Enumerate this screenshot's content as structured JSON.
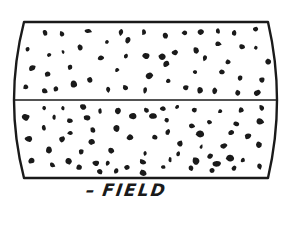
{
  "figure": {
    "type": "magnetic-particle field diagram",
    "caption_prefix": "–",
    "caption": "FIELD",
    "colors": {
      "ink": "#1a1a1a",
      "background": "#ffffff"
    },
    "frame": {
      "top_y": 22,
      "bottom_y": 178,
      "left_x_top": 24,
      "right_x_top": 268,
      "left_bulge_x": 12,
      "right_bulge_x": 278,
      "divider_y": 100
    },
    "particles": [
      [
        45,
        33
      ],
      [
        62,
        34
      ],
      [
        88,
        31
      ],
      [
        121,
        32
      ],
      [
        144,
        32
      ],
      [
        165,
        36
      ],
      [
        185,
        33
      ],
      [
        201,
        32
      ],
      [
        218,
        31
      ],
      [
        234,
        33
      ],
      [
        256,
        29
      ],
      [
        28,
        49
      ],
      [
        49,
        55
      ],
      [
        63,
        52
      ],
      [
        80,
        48
      ],
      [
        107,
        42
      ],
      [
        128,
        40
      ],
      [
        146,
        56
      ],
      [
        162,
        57
      ],
      [
        196,
        50
      ],
      [
        218,
        44
      ],
      [
        242,
        47
      ],
      [
        256,
        48
      ],
      [
        101,
        58
      ],
      [
        126,
        56
      ],
      [
        175,
        53
      ],
      [
        205,
        58
      ],
      [
        228,
        62
      ],
      [
        268,
        62
      ],
      [
        32,
        68
      ],
      [
        48,
        74
      ],
      [
        70,
        67
      ],
      [
        117,
        70
      ],
      [
        150,
        76
      ],
      [
        166,
        64
      ],
      [
        195,
        72
      ],
      [
        222,
        72
      ],
      [
        240,
        78
      ],
      [
        262,
        80
      ],
      [
        26,
        87
      ],
      [
        45,
        91
      ],
      [
        56,
        89
      ],
      [
        74,
        84
      ],
      [
        90,
        80
      ],
      [
        108,
        89
      ],
      [
        126,
        88
      ],
      [
        145,
        90
      ],
      [
        168,
        81
      ],
      [
        186,
        88
      ],
      [
        200,
        90
      ],
      [
        215,
        91
      ],
      [
        238,
        93
      ],
      [
        257,
        93
      ],
      [
        44,
        108
      ],
      [
        63,
        108
      ],
      [
        83,
        107
      ],
      [
        100,
        111
      ],
      [
        118,
        111
      ],
      [
        146,
        110
      ],
      [
        163,
        109
      ],
      [
        177,
        107
      ],
      [
        194,
        110
      ],
      [
        220,
        111
      ],
      [
        241,
        110
      ],
      [
        262,
        108
      ],
      [
        26,
        117
      ],
      [
        54,
        117
      ],
      [
        70,
        121
      ],
      [
        87,
        118
      ],
      [
        133,
        116
      ],
      [
        152,
        116
      ],
      [
        167,
        120
      ],
      [
        192,
        126
      ],
      [
        209,
        122
      ],
      [
        236,
        124
      ],
      [
        260,
        121
      ],
      [
        44,
        128
      ],
      [
        70,
        133
      ],
      [
        93,
        130
      ],
      [
        117,
        128
      ],
      [
        168,
        132
      ],
      [
        200,
        134
      ],
      [
        231,
        133
      ],
      [
        248,
        136
      ],
      [
        29,
        139
      ],
      [
        62,
        139
      ],
      [
        91,
        142
      ],
      [
        130,
        137
      ],
      [
        155,
        137
      ],
      [
        180,
        144
      ],
      [
        201,
        147
      ],
      [
        224,
        146
      ],
      [
        259,
        145
      ],
      [
        49,
        150
      ],
      [
        81,
        152
      ],
      [
        111,
        151
      ],
      [
        145,
        153
      ],
      [
        178,
        154
      ],
      [
        210,
        156
      ],
      [
        230,
        158
      ],
      [
        243,
        160
      ],
      [
        31,
        161
      ],
      [
        68,
        161
      ],
      [
        96,
        163
      ],
      [
        143,
        162
      ],
      [
        170,
        160
      ],
      [
        196,
        161
      ],
      [
        217,
        164
      ],
      [
        52,
        165
      ],
      [
        79,
        167
      ],
      [
        108,
        163
      ],
      [
        127,
        167
      ],
      [
        163,
        167
      ],
      [
        191,
        168
      ],
      [
        234,
        168
      ],
      [
        259,
        166
      ],
      [
        100,
        172
      ],
      [
        116,
        171
      ],
      [
        143,
        173
      ],
      [
        212,
        171
      ]
    ]
  }
}
